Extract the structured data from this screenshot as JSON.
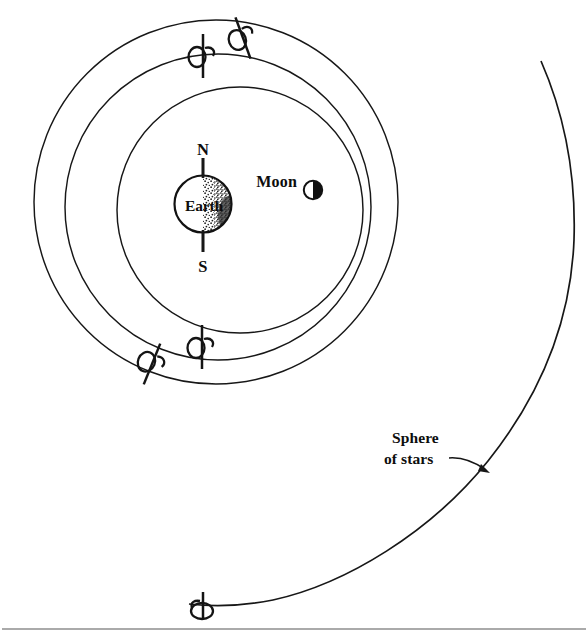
{
  "figure": {
    "kind": "astronomy-diagram",
    "background_color": "#ffffff",
    "ink_color": "#141414",
    "rule_color": "#8e8e8e",
    "width": 588,
    "height": 635
  },
  "labels": {
    "earth": "Earth",
    "moon": "Moon",
    "north_pole": "N",
    "south_pole": "S",
    "sphere_line_1": "Sphere",
    "sphere_line_2": "of stars"
  },
  "bodies": {
    "earth": {
      "name": "Earth",
      "center_x": 203,
      "center_y": 204,
      "radius": 29,
      "shading": "right-half-stippled"
    },
    "moon": {
      "name": "Moon",
      "center_x": 313,
      "center_y": 190,
      "radius": 9.5,
      "shading": "right-half-black"
    }
  },
  "axis": {
    "name": "earth-rotation-axis",
    "x": 203,
    "top_y": 158,
    "bottom_y": 252
  },
  "orbits": [
    {
      "name": "moon-orbit",
      "center_x": 240,
      "center_y": 210,
      "radius": 123,
      "rotation_markers": 2
    },
    {
      "name": "middle-sphere",
      "center_x": 218,
      "center_y": 207,
      "radius": 153,
      "rotation_markers": 2
    },
    {
      "name": "outer-sphere",
      "center_x": 216,
      "center_y": 202,
      "radius": 182,
      "rotation_markers": 2
    }
  ],
  "sphere_of_stars": {
    "name": "sphere-of-stars-arc",
    "center_x": 150,
    "center_y": 250,
    "radius": 425,
    "rotation_markers": 1
  },
  "rotation_markers": [
    {
      "id": "marker-middle-top",
      "x": 203,
      "y": 56,
      "angle": 0,
      "loop_side": "left",
      "loop_below": false
    },
    {
      "id": "marker-outer-top",
      "x": 242,
      "y": 38,
      "angle": -18,
      "loop_side": "left",
      "loop_below": false
    },
    {
      "id": "marker-middle-bot",
      "x": 202,
      "y": 347,
      "angle": 0,
      "loop_side": "left",
      "loop_below": false
    },
    {
      "id": "marker-outer-bot",
      "x": 152,
      "y": 364,
      "angle": 20,
      "loop_side": "left",
      "loop_below": false
    },
    {
      "id": "marker-stars-bot",
      "x": 203,
      "y": 600,
      "angle": 0,
      "loop_side": "center",
      "loop_below": true
    }
  ],
  "annotation": {
    "name": "sphere-of-stars-callout",
    "text_x": 392,
    "text_y_line1": 442,
    "text_y_line2": 463,
    "leader_from_x": 450,
    "leader_from_y": 459,
    "leader_to_x": 489,
    "leader_to_y": 472
  },
  "page_rule": {
    "name": "page-bottom-rule",
    "y": 629,
    "x_start": 2,
    "x_end": 586
  }
}
